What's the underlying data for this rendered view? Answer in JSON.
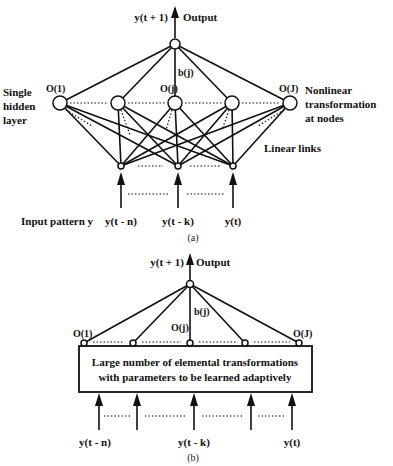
{
  "panel_a": {
    "output_var": "y(t + 1)",
    "output_label": "Output",
    "weight_label": "b(j)",
    "node_labels": {
      "first": "O(1)",
      "middle": "O(j)",
      "last": "O(J)"
    },
    "left_label": [
      "Single",
      "hidden",
      "layer"
    ],
    "right_label": [
      "Nonlinear",
      "transformation",
      "at nodes"
    ],
    "links_label": "Linear links",
    "input_caption": "Input pattern y",
    "inputs": [
      "y(t - n)",
      "y(t - k)",
      "y(t)"
    ],
    "caption": "(a)"
  },
  "panel_b": {
    "output_var": "y(t + 1)",
    "output_label": "Output",
    "weight_label": "b(j)",
    "node_labels": {
      "first": "O(1)",
      "middle": "O(j)",
      "last": "O(J)"
    },
    "box_text": [
      "Large number of elemental transformations",
      "with parameters to be learned adaptively"
    ],
    "inputs": [
      "y(t - n)",
      "y(t - k)",
      "y(t)"
    ],
    "caption": "(b)"
  }
}
